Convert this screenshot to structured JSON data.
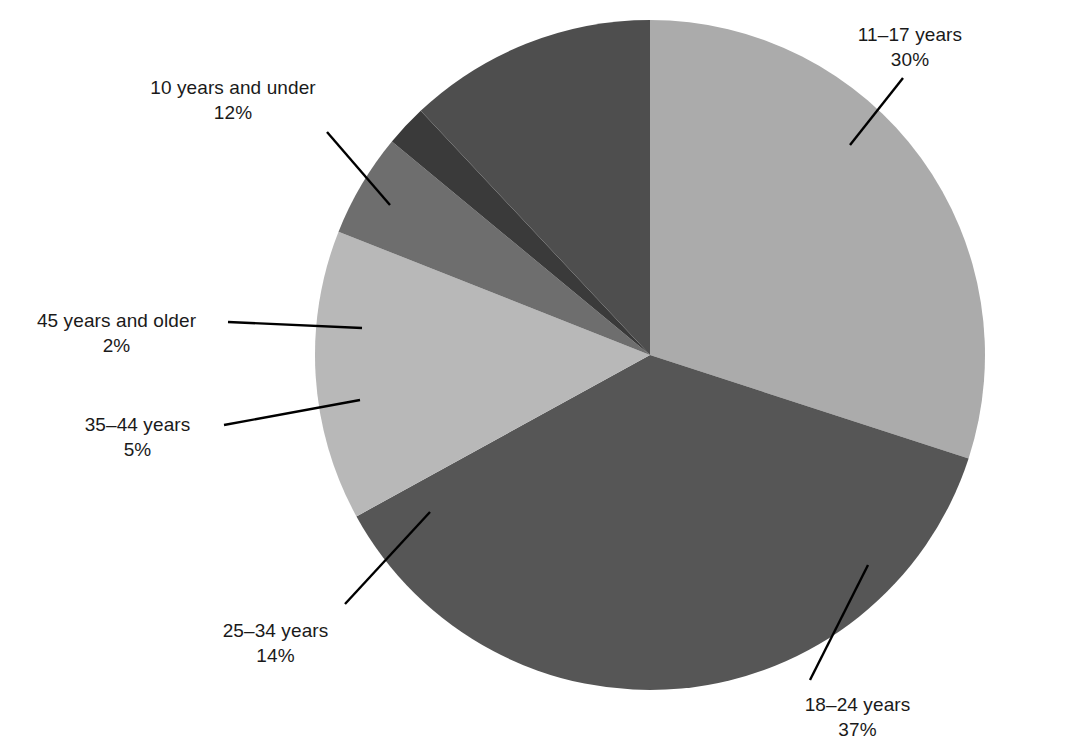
{
  "chart_data": {
    "type": "pie",
    "title": "",
    "subtitle": "",
    "xlabel": "",
    "ylabel": "",
    "legend_position": "none",
    "grid": false,
    "units": "percent",
    "total": 100,
    "start_angle_deg": 0,
    "direction": "clockwise",
    "categories": [
      "11–17 years",
      "18–24 years",
      "25–34 years",
      "35–44 years",
      "45 years and older",
      "10 years and under"
    ],
    "values": [
      30,
      37,
      14,
      5,
      2,
      12
    ],
    "value_labels": [
      "30%",
      "37%",
      "14%",
      "5%",
      "2%",
      "12%"
    ],
    "colors": [
      "#ababab",
      "#565656",
      "#b8b8b8",
      "#6e6e6e",
      "#3a3a3a",
      "#4e4e4e"
    ],
    "slices": [
      {
        "label": "11–17 years",
        "value": 30,
        "value_label": "30%",
        "color": "#ababab",
        "start_deg": 0,
        "end_deg": 108
      },
      {
        "label": "18–24 years",
        "value": 37,
        "value_label": "37%",
        "color": "#565656",
        "start_deg": 108,
        "end_deg": 241.2
      },
      {
        "label": "25–34 years",
        "value": 14,
        "value_label": "14%",
        "color": "#b8b8b8",
        "start_deg": 241.2,
        "end_deg": 291.6
      },
      {
        "label": "35–44 years",
        "value": 5,
        "value_label": "5%",
        "color": "#6e6e6e",
        "start_deg": 291.6,
        "end_deg": 309.6
      },
      {
        "label": "45 years and older",
        "value": 2,
        "value_label": "2%",
        "color": "#3a3a3a",
        "start_deg": 309.6,
        "end_deg": 316.8
      },
      {
        "label": "10 years and under",
        "value": 12,
        "value_label": "12%",
        "color": "#4e4e4e",
        "start_deg": 316.8,
        "end_deg": 360
      }
    ]
  },
  "geometry": {
    "center_x": 650,
    "center_y": 355,
    "radius": 335
  },
  "callouts": {
    "c11_17": {
      "category": "11–17 years",
      "percent": "30%"
    },
    "c18_24": {
      "category": "18–24 years",
      "percent": "37%"
    },
    "c25_34": {
      "category": "25–34 years",
      "percent": "14%"
    },
    "c35_44": {
      "category": "35–44 years",
      "percent": "5%"
    },
    "c45_older": {
      "category": "45 years and older",
      "percent": "2%"
    },
    "c10_under": {
      "category": "10 years and under",
      "percent": "12%"
    }
  }
}
